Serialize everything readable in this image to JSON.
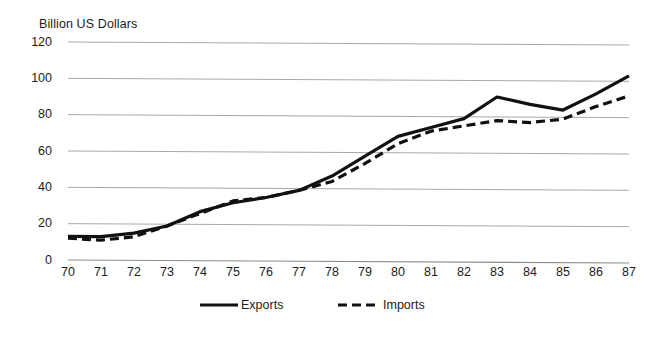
{
  "chart_data": {
    "type": "line",
    "title": "Billion US Dollars",
    "xlabel": "",
    "ylabel": "Billion US Dollars",
    "ylim": [
      0,
      120
    ],
    "yticks": [
      0,
      20,
      40,
      60,
      80,
      100,
      120
    ],
    "ytick_labels": [
      "0",
      "20",
      "40",
      "60",
      "80",
      "100",
      "120"
    ],
    "categories": [
      "70",
      "71",
      "72",
      "73",
      "74",
      "75",
      "76",
      "77",
      "78",
      "79",
      "80",
      "81",
      "82",
      "83",
      "84",
      "85",
      "86",
      "87"
    ],
    "x": [
      70,
      71,
      72,
      73,
      74,
      75,
      76,
      77,
      78,
      79,
      80,
      81,
      82,
      83,
      84,
      85,
      86,
      87
    ],
    "grid": true,
    "grid_axis": "y",
    "legend_position": "bottom",
    "series": [
      {
        "name": "Exports",
        "style": "solid",
        "color": "#111111",
        "values": [
          13,
          13,
          15,
          19,
          27,
          32,
          35,
          39,
          47,
          58,
          69,
          74,
          79,
          91,
          87,
          84,
          93,
          103
        ]
      },
      {
        "name": "Imports",
        "style": "dashed",
        "color": "#111111",
        "values": [
          12,
          11,
          13,
          19,
          26,
          33,
          35,
          39,
          44,
          54,
          65,
          72,
          75,
          78,
          77,
          79,
          86,
          92
        ]
      }
    ]
  },
  "legend": {
    "exports_label": "Exports",
    "imports_label": "Imports"
  },
  "colors": {
    "series": "#111111",
    "gridline": "#a8a8a8",
    "axis": "#8c8c8c",
    "text": "#1c1c1c",
    "background": "#ffffff"
  }
}
